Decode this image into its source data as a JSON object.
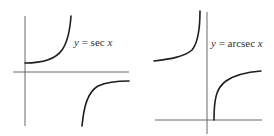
{
  "figure": {
    "panels": [
      {
        "label_lhs": "y",
        "label_eq": " = ",
        "label_fn": "sec ",
        "label_var": "x",
        "function": "sec x"
      },
      {
        "label_lhs": "y",
        "label_eq": " = ",
        "label_fn": "arcsec ",
        "label_var": "x",
        "function": "arcsec x"
      }
    ],
    "colors": {
      "curve": "#1e1e1e",
      "axis": "#5a5a5a",
      "background": "#ffffff"
    }
  }
}
